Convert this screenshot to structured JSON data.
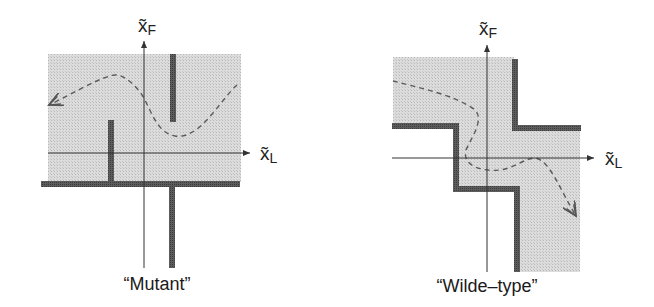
{
  "colors": {
    "region_fill": "#d6d6d6",
    "wall": "#555555",
    "axis": "#333333",
    "trajectory": "#5a5a5a"
  },
  "panels": [
    {
      "id": "mutant",
      "caption": "“Mutant”",
      "x_axis": {
        "symbol": "x̃",
        "subscript": "L"
      },
      "y_axis": {
        "symbol": "x̃",
        "subscript": "F"
      }
    },
    {
      "id": "wild-type",
      "caption": "“Wilde–type”",
      "x_axis": {
        "symbol": "x̃",
        "subscript": "L"
      },
      "y_axis": {
        "symbol": "x̃",
        "subscript": "F"
      }
    }
  ]
}
